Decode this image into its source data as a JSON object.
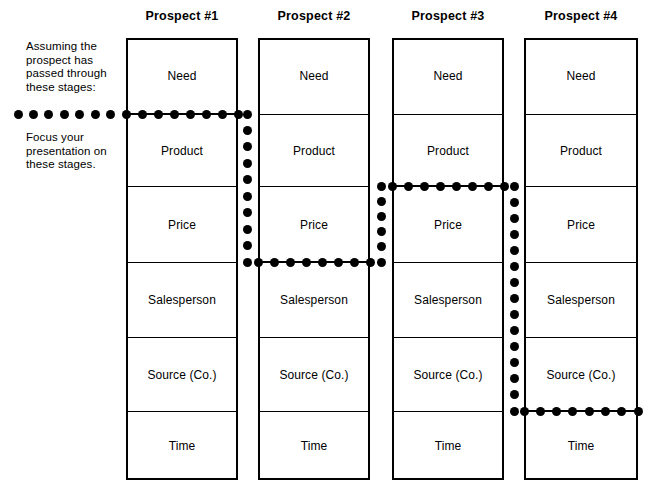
{
  "diagram": {
    "title_row": {
      "columns": [
        {
          "label": "Prospect #1"
        },
        {
          "label": "Prospect #2"
        },
        {
          "label": "Prospect #3"
        },
        {
          "label": "Prospect #4"
        }
      ]
    },
    "annotations": [
      {
        "id": "note-top",
        "text": "Assuming the prospect has passed through these stages:"
      },
      {
        "id": "note-bot",
        "text": "Focus your presentation on these stages."
      }
    ],
    "stages": [
      "Need",
      "Product",
      "Price",
      "Salesperson",
      "Source (Co.)",
      "Time"
    ],
    "columns": [
      {
        "name": "Prospect #1",
        "label": "Prospect #1",
        "stage_boundary_index": 1,
        "stage_boundary_label": "Need / Product",
        "cells": [
          "Need",
          "Product",
          "Price",
          "Salesperson",
          "Source (Co.)",
          "Time"
        ]
      },
      {
        "name": "Prospect #2",
        "label": "Prospect #2",
        "stage_boundary_index": 3,
        "stage_boundary_label": "Price / Salesperson",
        "cells": [
          "Need",
          "Product",
          "Price",
          "Salesperson",
          "Source (Co.)",
          "Time"
        ]
      },
      {
        "name": "Prospect #3",
        "label": "Prospect #3",
        "stage_boundary_index": 2,
        "stage_boundary_label": "Product / Price",
        "cells": [
          "Need",
          "Product",
          "Price",
          "Salesperson",
          "Source (Co.)",
          "Time"
        ]
      },
      {
        "name": "Prospect #4",
        "label": "Prospect #4",
        "stage_boundary_index": 5,
        "stage_boundary_label": "Source (Co.) / Time",
        "cells": [
          "Need",
          "Product",
          "Price",
          "Salesperson",
          "Source (Co.)",
          "Time"
        ]
      }
    ],
    "colors": {
      "ink": "#000000",
      "paper": "#ffffff"
    }
  },
  "layout": {
    "columns_px": [
      {
        "left": 126,
        "right": 238
      },
      {
        "left": 258,
        "right": 370
      },
      {
        "left": 392,
        "right": 504
      },
      {
        "left": 524,
        "right": 638
      }
    ],
    "row_dividers_px": [
      38,
      114,
      186,
      262,
      337,
      411,
      480
    ],
    "connector_dot_columns_px": [
      247,
      381,
      514
    ],
    "leader_start_x_px": 18
  }
}
